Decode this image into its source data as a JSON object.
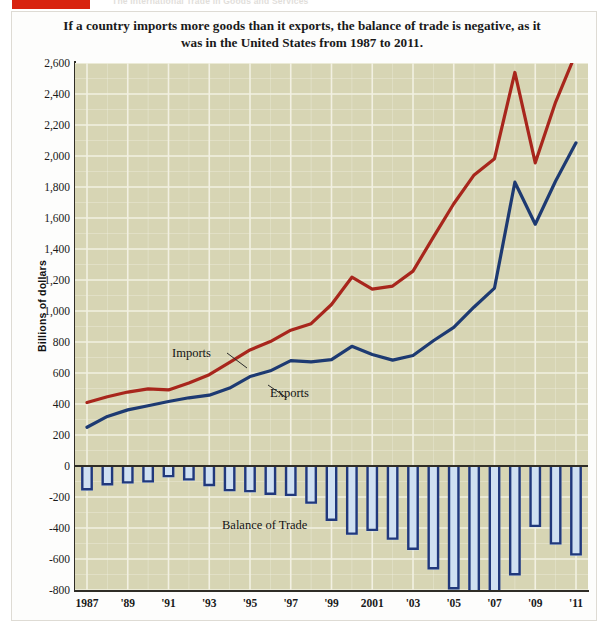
{
  "running_head": "The International Trade in Goods and Services",
  "title": "If a country imports more goods than it exports, the balance of trade is negative, as it was in the United States from 1987 to 2011.",
  "axis": {
    "ylabel": "Billions of dollars",
    "yticks": [
      "2,600",
      "2,400",
      "2,200",
      "2,000",
      "1,800",
      "1,600",
      "1,400",
      "1,200",
      "1,000",
      "800",
      "600",
      "400",
      "200",
      "0",
      "-200",
      "-400",
      "-600",
      "-800"
    ],
    "xticks": [
      "1987",
      "'89",
      "'91",
      "'93",
      "'95",
      "'97",
      "'99",
      "2001",
      "'03",
      "'05",
      "'07",
      "'09",
      "'11"
    ]
  },
  "annotations": {
    "imports": "Imports",
    "exports": "Exports",
    "balance": "Balance of Trade"
  },
  "colors": {
    "imports_line": "#a8261c",
    "exports_line": "#1d3a72",
    "bar_fill": "#cfe0f2",
    "bar_stroke": "#20387c",
    "plot_background": "#d7d5b4",
    "gridline": "#f2f0e2",
    "axis": "#2f2d26",
    "red_tab": "#d8230f"
  },
  "chart_data": {
    "type": "line",
    "title": "If a country imports more goods than it exports, the balance of trade is negative, as it was in the United States from 1987 to 2011.",
    "xlabel": "",
    "ylabel": "Billions of dollars",
    "ylim": [
      -800,
      2600
    ],
    "ytick_values": [
      2600,
      2400,
      2200,
      2000,
      1800,
      1600,
      1400,
      1200,
      1000,
      800,
      600,
      400,
      200,
      0,
      -200,
      -400,
      -600,
      -800
    ],
    "grid": true,
    "legend": "inline-annotations",
    "x": [
      1987,
      1988,
      1989,
      1990,
      1991,
      1992,
      1993,
      1994,
      1995,
      1996,
      1997,
      1998,
      1999,
      2000,
      2001,
      2002,
      2003,
      2004,
      2005,
      2006,
      2007,
      2008,
      2009,
      2010,
      2011
    ],
    "series": [
      {
        "name": "Imports",
        "type": "line",
        "color": "#a8261c",
        "values": [
          410,
          447,
          477,
          498,
          491,
          536,
          589,
          668,
          749,
          803,
          876,
          918,
          1042,
          1218,
          1141,
          1161,
          1257,
          1477,
          1692,
          1878,
          1983,
          2539,
          1956,
          2348,
          2665
        ]
      },
      {
        "name": "Exports",
        "type": "line",
        "color": "#1d3a72",
        "values": [
          250,
          320,
          362,
          389,
          416,
          440,
          457,
          503,
          577,
          614,
          680,
          672,
          686,
          772,
          719,
          683,
          713,
          808,
          894,
          1026,
          1148,
          1831,
          1560,
          1839,
          2085
        ]
      },
      {
        "name": "Balance of Trade",
        "type": "bar",
        "color": "#cfe0f2",
        "values": [
          -160,
          -127,
          -115,
          -109,
          -75,
          -96,
          -132,
          -165,
          -172,
          -189,
          -196,
          -246,
          -356,
          -446,
          -422,
          -478,
          -544,
          -669,
          -798,
          -852,
          -835,
          -708,
          -396,
          -509,
          -580
        ]
      }
    ]
  }
}
